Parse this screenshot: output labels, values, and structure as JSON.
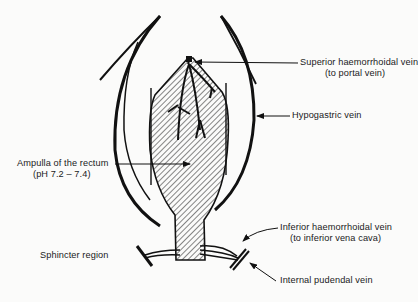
{
  "diagram": {
    "type": "anatomical-diagram",
    "colors": {
      "ink": "#111111",
      "background": "#fbfbfa",
      "hatch": "#222222"
    }
  },
  "labels": {
    "superior_vein": {
      "line1": "Superior haemorrhoidal vein",
      "line2": "(to portal vein)"
    },
    "hypogastric_vein": {
      "line1": "Hypogastric vein"
    },
    "ampulla": {
      "line1": "Ampulla of the rectum",
      "line2": "(pH 7.2 – 7.4)"
    },
    "sphincter": {
      "line1": "Sphincter region"
    },
    "inferior_vein": {
      "line1": "Inferior haemorrhoidal vein",
      "line2": "(to inferior vena cava)"
    },
    "pudendal_vein": {
      "line1": "Internal pudendal vein"
    }
  }
}
